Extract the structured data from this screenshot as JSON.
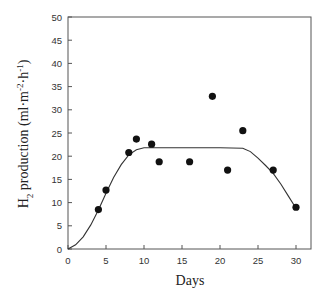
{
  "chart_data": {
    "type": "scatter",
    "title": "",
    "xlabel": "Days",
    "ylabel": "H2 production (ml·m-2·h-1)",
    "ylabel_parts": {
      "pre": "H",
      "sub": "2",
      "mid": " production (ml·m",
      "sup1": "-2",
      "mid2": "·h",
      "sup2": "-1",
      "post": ")"
    },
    "xlim": [
      0,
      32
    ],
    "ylim": [
      0,
      50
    ],
    "xticks": [
      0,
      5,
      10,
      15,
      20,
      25,
      30
    ],
    "yticks": [
      0,
      5,
      10,
      15,
      20,
      25,
      30,
      35,
      40,
      45,
      50
    ],
    "grid": false,
    "legend": null,
    "series": [
      {
        "name": "measured",
        "marker": "filled-circle",
        "color": "#111111",
        "x": [
          4,
          5,
          8,
          9,
          11,
          12,
          16,
          19,
          21,
          23,
          27,
          30
        ],
        "y": [
          8.5,
          12.7,
          20.8,
          23.7,
          22.6,
          18.8,
          18.8,
          32.9,
          17.0,
          25.5,
          17.0,
          9.0
        ]
      },
      {
        "name": "fitted curve",
        "type": "line",
        "color": "#333333",
        "x": [
          0,
          1,
          2,
          3,
          4,
          5,
          6,
          7,
          8,
          9,
          10,
          11,
          15,
          20,
          23,
          24,
          25,
          26,
          27,
          28,
          29,
          30
        ],
        "y": [
          0,
          0.9,
          2.6,
          5.2,
          8.4,
          12.0,
          15.4,
          18.2,
          20.3,
          21.4,
          21.8,
          21.8,
          21.8,
          21.8,
          21.7,
          21.0,
          19.6,
          18.0,
          16.3,
          14.0,
          11.4,
          8.8
        ]
      }
    ]
  }
}
